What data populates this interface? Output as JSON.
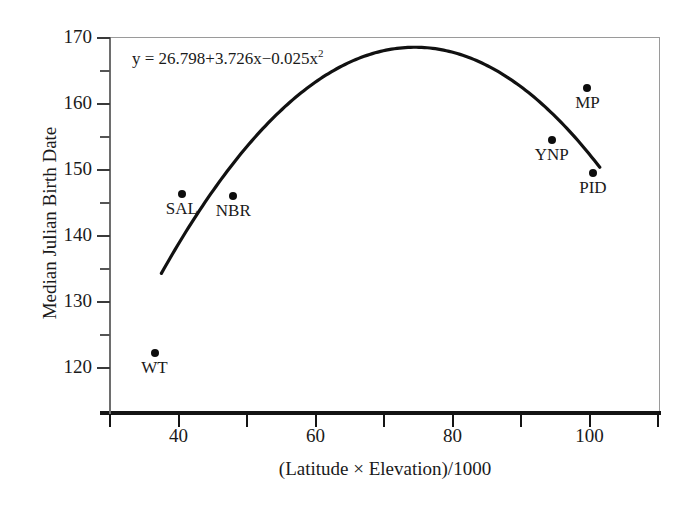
{
  "chart_data": {
    "type": "scatter",
    "title": "",
    "xlabel": "(Latitude × Elevation)/1000",
    "ylabel": "Median Julian Birth Date",
    "xlim": [
      30,
      110
    ],
    "ylim": [
      115,
      172
    ],
    "grid": false,
    "legend": "none",
    "annotations": [
      {
        "name": "regression-equation",
        "text": "y = 26.798+3.726x−0.025x",
        "exponent": "2",
        "full_text": "y = 26.798+3.726x−0.025x²"
      }
    ],
    "x_ticks_major": [
      40,
      60,
      80,
      100
    ],
    "x_tick_labels": [
      "40",
      "60",
      "80",
      "100"
    ],
    "x_ticks_minor": [
      30,
      50,
      70,
      90,
      110
    ],
    "y_ticks_major": [
      120,
      130,
      140,
      150,
      160,
      170
    ],
    "y_tick_labels": [
      "120",
      "130",
      "140",
      "150",
      "160",
      "170"
    ],
    "y_ticks_minor": [
      125,
      135,
      145,
      155,
      165
    ],
    "points": [
      {
        "label": "WT",
        "x": 36.5,
        "y": 122.3
      },
      {
        "label": "SAL",
        "x": 40.5,
        "y": 146.4
      },
      {
        "label": "NBR",
        "x": 48.0,
        "y": 146.0
      },
      {
        "label": "YNP",
        "x": 94.5,
        "y": 154.6
      },
      {
        "label": "MP",
        "x": 99.7,
        "y": 162.5
      },
      {
        "label": "PID",
        "x": 100.5,
        "y": 149.5
      }
    ],
    "fit_curve": {
      "name": "quadratic-regression",
      "equation": "y = 26.798 + 3.726x - 0.025x^2",
      "coefficients": {
        "intercept": 26.798,
        "linear": 3.726,
        "quadratic": -0.025
      },
      "x_start": 37.5,
      "x_end": 101.5,
      "vertex_x": 74.5,
      "vertex_y": 168.6
    }
  }
}
